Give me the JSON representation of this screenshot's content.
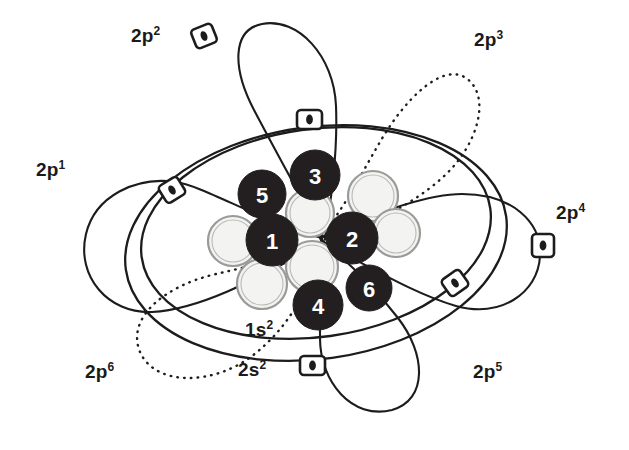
{
  "figure": {
    "background_color": "#ffffff",
    "line_color": "#1c1c1c",
    "dark_nucleon_color": "#231f20",
    "light_nucleon_color": "#f3f3f1",
    "light_nucleon_ring_color": "#9a9a98",
    "label_color": "#1a1a1a"
  },
  "shell_labels": [
    {
      "id": "1s2",
      "base": "1s",
      "exp": "2",
      "text": "1s²",
      "x": 245,
      "y": 318
    },
    {
      "id": "2s2",
      "base": "2s",
      "exp": "2",
      "text": "2s²",
      "x": 238,
      "y": 358
    }
  ],
  "orbital_labels": [
    {
      "id": "2p1",
      "base": "2p",
      "exp": "1",
      "text": "2p¹",
      "x": 36,
      "y": 158,
      "style": "solid"
    },
    {
      "id": "2p2",
      "base": "2p",
      "exp": "2",
      "text": "2p²",
      "x": 131,
      "y": 24,
      "style": "solid"
    },
    {
      "id": "2p3",
      "base": "2p",
      "exp": "3",
      "text": "2p³",
      "x": 474,
      "y": 28,
      "style": "dotted"
    },
    {
      "id": "2p4",
      "base": "2p",
      "exp": "4",
      "text": "2p⁴",
      "x": 556,
      "y": 201,
      "style": "solid"
    },
    {
      "id": "2p5",
      "base": "2p",
      "exp": "5",
      "text": "2p⁵",
      "x": 473,
      "y": 360,
      "style": "solid"
    },
    {
      "id": "2p6",
      "base": "2p",
      "exp": "6",
      "text": "2p⁶",
      "x": 85,
      "y": 360,
      "style": "dotted"
    }
  ],
  "nucleons_dark": [
    {
      "number": "1",
      "cx": 272,
      "cy": 240,
      "r": 26
    },
    {
      "number": "2",
      "cx": 352,
      "cy": 238,
      "r": 26
    },
    {
      "number": "3",
      "cx": 315,
      "cy": 175,
      "r": 25
    },
    {
      "number": "4",
      "cx": 318,
      "cy": 305,
      "r": 25
    },
    {
      "number": "5",
      "cx": 262,
      "cy": 194,
      "r": 24
    },
    {
      "number": "6",
      "cx": 369,
      "cy": 288,
      "r": 23
    }
  ],
  "nucleons_light": [
    {
      "id": "light-left",
      "cx": 233,
      "cy": 241,
      "r": 25
    },
    {
      "id": "light-upper-mid",
      "cx": 310,
      "cy": 213,
      "r": 24
    },
    {
      "id": "light-lower-mid",
      "cx": 312,
      "cy": 267,
      "r": 26
    },
    {
      "id": "light-bottom-left",
      "cx": 262,
      "cy": 284,
      "r": 25
    },
    {
      "id": "light-upper-right",
      "cx": 373,
      "cy": 196,
      "r": 25
    },
    {
      "id": "light-right",
      "cx": 396,
      "cy": 233,
      "r": 24
    }
  ],
  "electron_markers": [
    {
      "id": "marker-2p2",
      "x": 204,
      "y": 36,
      "rotation": -22,
      "shape": "rounded-square"
    },
    {
      "id": "marker-top",
      "x": 309,
      "y": 120,
      "rotation": 0,
      "shape": "rounded-rect"
    },
    {
      "id": "marker-2p1",
      "x": 172,
      "y": 190,
      "rotation": -30,
      "shape": "rounded-square"
    },
    {
      "id": "marker-2p4",
      "x": 543,
      "y": 245,
      "rotation": 0,
      "shape": "rounded-rect"
    },
    {
      "id": "marker-right-low",
      "x": 455,
      "y": 283,
      "rotation": -35,
      "shape": "rounded-square"
    },
    {
      "id": "marker-bottom",
      "x": 312,
      "y": 365,
      "rotation": 0,
      "shape": "rounded-rect"
    }
  ],
  "shells": [
    {
      "id": "1s2-ellipse",
      "type": "ellipse",
      "cx": 316,
      "cy": 233,
      "rx": 176,
      "ry": 104,
      "rotation": -8,
      "style": "solid"
    },
    {
      "id": "2s2-ellipse",
      "type": "ellipse",
      "cx": 316,
      "cy": 243,
      "rx": 192,
      "ry": 116,
      "rotation": -8,
      "style": "solid"
    }
  ]
}
